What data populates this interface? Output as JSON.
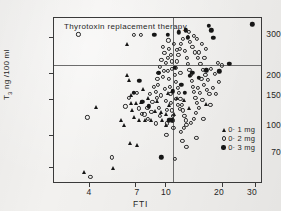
{
  "figure": {
    "title": "Thyrotoxin replacement therapy",
    "width": 281,
    "height": 211,
    "background_color": "#f2f1ef",
    "ink_color": "#1f1f1f"
  },
  "axes": {
    "x_title": "FTI",
    "y_title_main": "T",
    "y_title_sub": "3",
    "y_title_rest": " ng /100 ml",
    "x_ticks": [
      "4",
      "7",
      "10",
      "20",
      "30"
    ],
    "y_ticks": [
      "300",
      "200",
      "150",
      "100",
      "70"
    ]
  },
  "legend": {
    "items": [
      {
        "symbol": "filled-triangle",
        "label": "0· 1 mg"
      },
      {
        "symbol": "open-circle",
        "label": "0· 2 mg"
      },
      {
        "symbol": "filled-circle",
        "label": "0· 3 mg"
      }
    ]
  },
  "chart_data": {
    "type": "scatter",
    "title": "Thyrotoxin replacement therapy",
    "xlabel": "FTI",
    "ylabel": "T3 ng/100ml",
    "xscale": "log",
    "yscale": "log",
    "xlim": [
      2.6,
      33
    ],
    "ylim": [
      58,
      370
    ],
    "grid": false,
    "legend_position": "lower-right",
    "reference_lines": [
      {
        "orientation": "horizontal",
        "value": 220
      },
      {
        "orientation": "vertical",
        "value": 11.0
      }
    ],
    "series": [
      {
        "name": "0· 1 mg",
        "marker": "filled-triangle",
        "color": "#161616",
        "points": [
          [
            3.75,
            66
          ],
          [
            5.3,
            69
          ],
          [
            4.35,
            137
          ],
          [
            6.1,
            112
          ],
          [
            6.55,
            92
          ],
          [
            7.1,
            90
          ],
          [
            6.3,
            196
          ],
          [
            6.45,
            186
          ],
          [
            6.6,
            143
          ],
          [
            6.75,
            133
          ],
          [
            6.9,
            123
          ],
          [
            7.05,
            143
          ],
          [
            7.5,
            145
          ],
          [
            7.35,
            119
          ],
          [
            7.9,
            118
          ],
          [
            8.5,
            118
          ],
          [
            6.35,
            278
          ],
          [
            6.6,
            157
          ],
          [
            8.9,
            131
          ],
          [
            9.5,
            129
          ],
          [
            10.2,
            127
          ],
          [
            9.7,
            118
          ],
          [
            10.4,
            160
          ],
          [
            10.5,
            140
          ],
          [
            10.6,
            120
          ],
          [
            11.6,
            152
          ],
          [
            12.6,
            148
          ],
          [
            13.4,
            135
          ],
          [
            16.6,
            142
          ],
          [
            10.9,
            163
          ],
          [
            8.2,
            152
          ],
          [
            9.1,
            146
          ],
          [
            7.7,
            168
          ],
          [
            10.1,
            112
          ],
          [
            11.2,
            126
          ],
          [
            5.85,
            118
          ]
        ]
      },
      {
        "name": "0· 2 mg",
        "marker": "open-circle",
        "color": "#2b2b2b",
        "points": [
          [
            3.5,
            308
          ],
          [
            3.9,
            122
          ],
          [
            4.05,
            63
          ],
          [
            5.25,
            78
          ],
          [
            6.9,
            305
          ],
          [
            7.45,
            305
          ],
          [
            6.45,
            152
          ],
          [
            6.2,
            138
          ],
          [
            7.15,
            161
          ],
          [
            7.3,
            135
          ],
          [
            7.55,
            127
          ],
          [
            7.8,
            126
          ],
          [
            8.15,
            120
          ],
          [
            8.6,
            145
          ],
          [
            8.95,
            162
          ],
          [
            9.2,
            176
          ],
          [
            9.35,
            136
          ],
          [
            9.55,
            156
          ],
          [
            9.75,
            192
          ],
          [
            9.9,
            205
          ],
          [
            10.0,
            168
          ],
          [
            10.1,
            146
          ],
          [
            10.25,
            133
          ],
          [
            10.4,
            205
          ],
          [
            10.5,
            188
          ],
          [
            10.6,
            172
          ],
          [
            10.7,
            158
          ],
          [
            10.8,
            144
          ],
          [
            10.9,
            132
          ],
          [
            11.0,
            124
          ],
          [
            11.05,
            118
          ],
          [
            10.95,
            210
          ],
          [
            10.85,
            228
          ],
          [
            10.75,
            246
          ],
          [
            10.55,
            262
          ],
          [
            10.35,
            238
          ],
          [
            10.15,
            224
          ],
          [
            9.95,
            250
          ],
          [
            9.8,
            268
          ],
          [
            9.6,
            232
          ],
          [
            9.45,
            214
          ],
          [
            9.25,
            200
          ],
          [
            11.3,
            196
          ],
          [
            11.5,
            182
          ],
          [
            11.7,
            170
          ],
          [
            11.9,
            160
          ],
          [
            12.1,
            150
          ],
          [
            12.3,
            140
          ],
          [
            12.5,
            132
          ],
          [
            12.7,
            124
          ],
          [
            12.9,
            118
          ],
          [
            11.4,
            212
          ],
          [
            11.6,
            228
          ],
          [
            11.8,
            244
          ],
          [
            12.0,
            262
          ],
          [
            12.2,
            278
          ],
          [
            12.45,
            292
          ],
          [
            12.8,
            256
          ],
          [
            13.1,
            238
          ],
          [
            13.3,
            222
          ],
          [
            13.5,
            208
          ],
          [
            13.7,
            196
          ],
          [
            13.9,
            184
          ],
          [
            14.1,
            172
          ],
          [
            14.3,
            162
          ],
          [
            14.5,
            152
          ],
          [
            14.8,
            144
          ],
          [
            15.1,
            136
          ],
          [
            13.2,
            300
          ],
          [
            13.6,
            284
          ],
          [
            14.0,
            268
          ],
          [
            14.4,
            252
          ],
          [
            14.9,
            236
          ],
          [
            15.4,
            222
          ],
          [
            15.9,
            208
          ],
          [
            16.4,
            196
          ],
          [
            15.6,
            188
          ],
          [
            16.1,
            176
          ],
          [
            16.7,
            166
          ],
          [
            17.2,
            158
          ],
          [
            15.0,
            170
          ],
          [
            15.3,
            160
          ],
          [
            14.6,
            128
          ],
          [
            14.2,
            120
          ],
          [
            13.8,
            115
          ],
          [
            13.0,
            112
          ],
          [
            12.6,
            108
          ],
          [
            12.2,
            104
          ],
          [
            14.7,
            97
          ],
          [
            13.0,
            88
          ],
          [
            11.3,
            77
          ],
          [
            15.8,
            148
          ],
          [
            16.9,
            186
          ],
          [
            17.6,
            210
          ],
          [
            18.3,
            198
          ],
          [
            19.1,
            224
          ],
          [
            20.0,
            218
          ],
          [
            17.9,
            170
          ],
          [
            18.6,
            158
          ],
          [
            19.4,
            182
          ],
          [
            16.2,
            236
          ],
          [
            15.2,
            252
          ],
          [
            16.5,
            262
          ],
          [
            15.7,
            276
          ],
          [
            14.8,
            292
          ],
          [
            13.4,
            316
          ],
          [
            14.3,
            302
          ],
          [
            11.6,
            260
          ],
          [
            11.2,
            276
          ],
          [
            10.45,
            288
          ],
          [
            9.15,
            188
          ],
          [
            8.75,
            172
          ],
          [
            8.35,
            158
          ],
          [
            9.05,
            152
          ],
          [
            9.4,
            124
          ],
          [
            8.5,
            130
          ],
          [
            10.3,
            114
          ],
          [
            11.1,
            108
          ],
          [
            10.2,
            100
          ],
          [
            12.4,
            94
          ],
          [
            16.0,
            120
          ],
          [
            17.4,
            140
          ],
          [
            12.1,
            200
          ],
          [
            11.45,
            150
          ],
          [
            11.75,
            140
          ],
          [
            12.05,
            134
          ],
          [
            9.0,
            114
          ],
          [
            8.1,
            136
          ]
        ]
      },
      {
        "name": "0· 3 mg",
        "marker": "filled-circle",
        "color": "#161616",
        "points": [
          [
            8.8,
            306
          ],
          [
            10.4,
            306
          ],
          [
            11.9,
            316
          ],
          [
            13.2,
            296
          ],
          [
            17.1,
            340
          ],
          [
            29.0,
            345
          ],
          [
            12.95,
            322
          ],
          [
            17.6,
            322
          ],
          [
            21.9,
            222
          ],
          [
            16.6,
            206
          ],
          [
            14.0,
            200
          ],
          [
            9.3,
            200
          ],
          [
            7.35,
            183
          ],
          [
            6.85,
            160
          ],
          [
            11.0,
            163
          ],
          [
            13.6,
            194
          ],
          [
            15.1,
            190
          ],
          [
            12.2,
            176
          ],
          [
            10.9,
            118
          ],
          [
            9.6,
            78
          ],
          [
            10.5,
            118
          ],
          [
            11.3,
            212
          ],
          [
            8.25,
            138
          ],
          [
            7.6,
            145
          ],
          [
            18.0,
            296
          ],
          [
            19.4,
            204
          ],
          [
            12.8,
            160
          ]
        ]
      }
    ]
  }
}
